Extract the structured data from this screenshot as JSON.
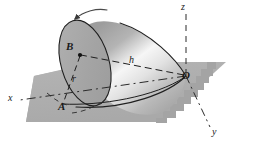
{
  "figure": {
    "kind": "engineering-mechanics-diagram",
    "width": 256,
    "height": 154,
    "background_color": "#ffffff"
  },
  "colors": {
    "plane_fill": "#b0b0b0",
    "plane_fill_dark": "#9a9a9a",
    "cone_base_fill": "#a8a8a8",
    "cone_body_light": "#f4f4f4",
    "cone_body_mid": "#c9c9c9",
    "cone_body_dark": "#9d9d9d",
    "line_color": "#1a1a1a",
    "dash_color": "#2b2b2b"
  },
  "points": [
    {
      "id": "O",
      "label": "O",
      "role": "apex-origin",
      "x": 186,
      "y": 76
    },
    {
      "id": "A",
      "label": "A",
      "role": "contact-point-on-plane",
      "x": 61,
      "y": 107
    },
    {
      "id": "B",
      "label": "B",
      "role": "base-center",
      "x": 70,
      "y": 47
    }
  ],
  "dimensions": [
    {
      "id": "r",
      "label": "r",
      "role": "base-radius",
      "x": 74,
      "y": 78
    },
    {
      "id": "h",
      "label": "h",
      "role": "slant-axis-height",
      "x": 131,
      "y": 60
    }
  ],
  "axes": [
    {
      "id": "x",
      "label": "x",
      "style": "dash-dot",
      "x": 10,
      "y": 97
    },
    {
      "id": "y",
      "label": "y",
      "style": "dash-dot",
      "x": 214,
      "y": 131
    },
    {
      "id": "z",
      "label": "z",
      "style": "dashed",
      "x": 183,
      "y": 3
    }
  ],
  "annotations": [
    {
      "id": "spin-arrow",
      "label": "rotation-arrow",
      "role": "curved-arrow-over-cone-top"
    },
    {
      "id": "base-dot-B",
      "label": "center-marker",
      "role": "filled-dot-at-B"
    }
  ]
}
